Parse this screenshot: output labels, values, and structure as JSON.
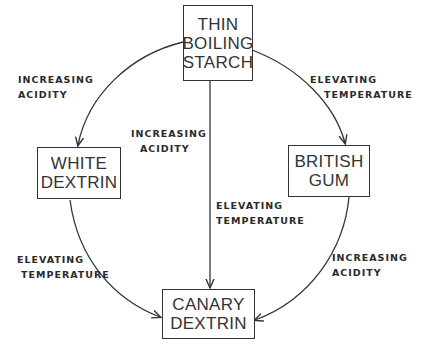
{
  "diagram": {
    "nodes": {
      "thin_boiling_starch": {
        "lines": [
          "THIN",
          "BOILING",
          "STARCH"
        ]
      },
      "white_dextrin": {
        "lines": [
          "WHITE",
          "DEXTRIN"
        ]
      },
      "british_gum": {
        "lines": [
          "BRITISH",
          "GUM"
        ]
      },
      "canary_dextrin": {
        "lines": [
          "CANARY",
          "DEXTRIN"
        ]
      }
    },
    "edges": {
      "starch_to_white": {
        "from": "THIN BOILING STARCH",
        "to": "WHITE DEXTRIN",
        "label": [
          "INCREASING",
          "ACIDITY"
        ]
      },
      "starch_to_british": {
        "from": "THIN BOILING STARCH",
        "to": "BRITISH GUM",
        "label": [
          "ELEVATING",
          "TEMPERATURE"
        ]
      },
      "white_to_canary": {
        "from": "WHITE DEXTRIN",
        "to": "CANARY DEXTRIN",
        "label": [
          "ELEVATING",
          "TEMPERATURE"
        ]
      },
      "british_to_canary": {
        "from": "BRITISH GUM",
        "to": "CANARY DEXTRIN",
        "label": [
          "INCREASING",
          "ACIDITY"
        ]
      },
      "starch_to_canary": {
        "from": "THIN BOILING STARCH",
        "to": "CANARY DEXTRIN",
        "label_upper": [
          "INCREASING",
          "ACIDITY"
        ],
        "label_lower": [
          "ELEVATING",
          "TEMPERATURE"
        ]
      }
    },
    "colors": {
      "line": "#333333",
      "background": "#ffffff"
    }
  }
}
